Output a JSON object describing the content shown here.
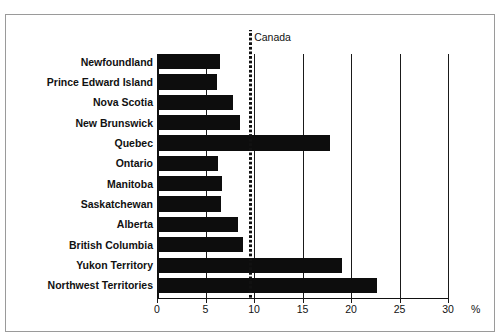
{
  "clipped_caption": {
    "left": "",
    "right": ""
  },
  "chart_data": {
    "type": "bar",
    "orientation": "horizontal",
    "title": "",
    "xlabel": "%",
    "ylabel": "",
    "xlim": [
      0,
      30
    ],
    "xticks": [
      0,
      5,
      10,
      15,
      20,
      25,
      30
    ],
    "xtick_labels": [
      "0",
      "5",
      "10",
      "15",
      "20",
      "25",
      "30"
    ],
    "grid": true,
    "grid_axis": "x",
    "legend": false,
    "bar_color": "#0d0d0d",
    "categories": [
      "Newfoundland",
      "Prince Edward Island",
      "Nova Scotia",
      "New Brunswick",
      "Quebec",
      "Ontario",
      "Manitoba",
      "Saskatchewan",
      "Alberta",
      "British Columbia",
      "Yukon Territory",
      "Northwest Territories"
    ],
    "values": [
      6.5,
      6.2,
      7.8,
      8.6,
      17.8,
      6.3,
      6.7,
      6.6,
      8.3,
      8.9,
      19.1,
      22.7
    ],
    "annotations": [
      {
        "name": "canada-reference-line",
        "label": "Canada",
        "value": 9.5,
        "style": "dotted-vertical",
        "color": "#111111"
      }
    ]
  }
}
